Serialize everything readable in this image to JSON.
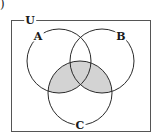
{
  "figure": {
    "marker": ")"
  },
  "diagram": {
    "type": "venn-3-set",
    "universe_label": "U",
    "sets": [
      {
        "id": "A",
        "label": "A",
        "cx": 59,
        "cy": 61,
        "r": 32
      },
      {
        "id": "B",
        "label": "B",
        "cx": 102,
        "cy": 61,
        "r": 32
      },
      {
        "id": "C",
        "label": "C",
        "cx": 80,
        "cy": 93,
        "r": 32
      }
    ],
    "shaded_region": "C ∩ (A ∪ B)",
    "colors": {
      "stroke": "#2a2a2a",
      "shade": "#d3d3d3",
      "background": "#ffffff"
    }
  }
}
